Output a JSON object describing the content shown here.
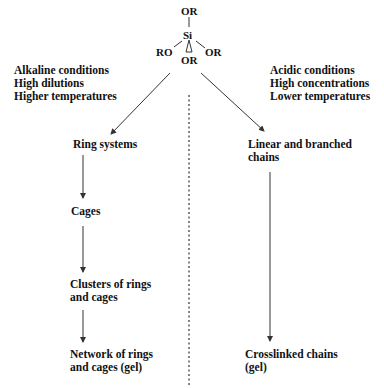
{
  "molecule": {
    "center": "Si",
    "top": "OR",
    "left": "RO",
    "right": "OR",
    "bottom": "OR"
  },
  "left_branch": {
    "conditions": [
      "Alkaline conditions",
      "High dilutions",
      "Higher temperatures"
    ],
    "stages": [
      {
        "line1": "Ring systems",
        "line2": ""
      },
      {
        "line1": "Cages",
        "line2": ""
      },
      {
        "line1": "Clusters of rings",
        "line2": "and cages"
      },
      {
        "line1": "Network of rings",
        "line2": "and cages (gel)"
      }
    ]
  },
  "right_branch": {
    "conditions": [
      "Acidic conditions",
      "High concentrations",
      "Lower temperatures"
    ],
    "stages": [
      {
        "line1": "Linear and branched",
        "line2": "chains"
      },
      {
        "line1": "Crosslinked chains",
        "line2": "(gel)"
      }
    ]
  },
  "colors": {
    "text": "#111111",
    "lines": "#333333",
    "background": "#ffffff"
  }
}
